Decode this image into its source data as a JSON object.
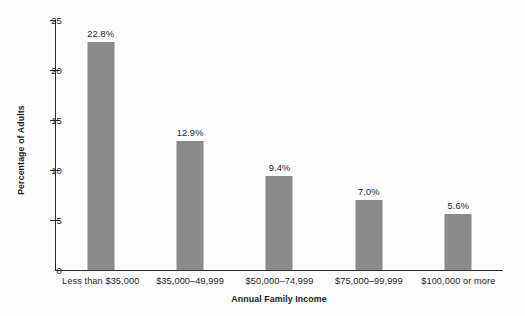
{
  "chart_data": {
    "type": "bar",
    "title": "",
    "subtitle": "",
    "xlabel": "Annual Family Income",
    "ylabel": "Percentage of Adults",
    "categories": [
      "Less than $35,000",
      "$35,000–49,999",
      "$50,000–74,999",
      "$75,000–99,999",
      "$100,000 or more"
    ],
    "values": [
      22.8,
      12.9,
      9.4,
      7.0,
      5.6
    ],
    "data_labels": [
      "22.8%",
      "12.9%",
      "9.4%",
      "7.0%",
      "5.6%"
    ],
    "ylim": [
      0,
      25
    ],
    "yticks": [
      0,
      5,
      10,
      15,
      20,
      25
    ],
    "ytick_labels": [
      "0",
      "5",
      "10",
      "15",
      "20",
      "25"
    ],
    "grid": false,
    "legend": null,
    "bar_color": "#8a8a8a",
    "axis_color": "#2b2b2b",
    "background_color": "#fdfdfd"
  }
}
